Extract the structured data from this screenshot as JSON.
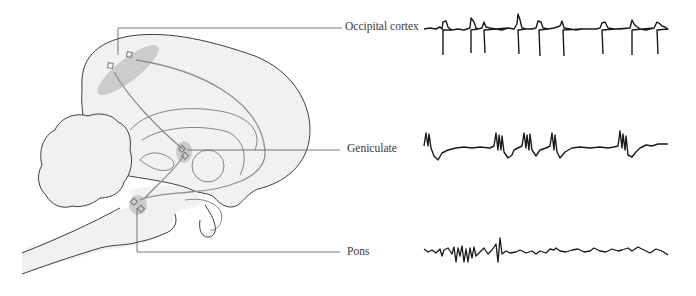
{
  "figure": {
    "colors": {
      "brain_fill": "#f1f1f1",
      "brain_outline": "#2a2a2a",
      "pathway": "#8f8f8f",
      "highlight": "#c8c8c8",
      "leader_line": "#555555",
      "trace": "#1a1a1a",
      "label_text": "#3a3a3a"
    }
  },
  "labels": {
    "occipital": "Occipital cortex",
    "geniculate": "Geniculate",
    "pons": "Pons"
  },
  "traces": [
    {
      "name": "occipital-cortex-trace",
      "pattern": "regular sharp negative spikes with positive overshoot",
      "spike_count": 9
    },
    {
      "name": "geniculate-trace",
      "pattern": "bursts of multiple spikes separated by slow waves",
      "burst_count": 5
    },
    {
      "name": "pons-trace",
      "pattern": "irregular low-amplitude activity with clustered spikes",
      "spike_cluster_count": 1
    }
  ]
}
